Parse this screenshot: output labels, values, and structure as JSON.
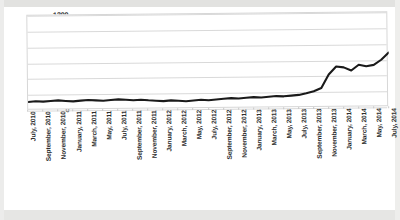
{
  "chart_data": {
    "type": "line",
    "title": "",
    "xlabel": "",
    "ylabel": "",
    "ylim": [
      0,
      1200
    ],
    "ytick_step": 200,
    "yticks": [
      1200,
      1000,
      800,
      600,
      400,
      200,
      0
    ],
    "grid": true,
    "legend": "none",
    "line_color": "#1a1a1a",
    "categories": [
      "July, 2010",
      "August, 2010",
      "September, 2010",
      "October, 2010",
      "November, 2010",
      "December, 2010",
      "January, 2011",
      "February, 2011",
      "March, 2011",
      "April, 2011",
      "May, 2011",
      "June, 2011",
      "July, 2011",
      "August, 2011",
      "September, 2011",
      "October, 2011",
      "November, 2011",
      "December, 2011",
      "January, 2012",
      "February, 2012",
      "March, 2012",
      "April, 2012",
      "May, 2012",
      "June, 2012",
      "July, 2012",
      "August, 2012",
      "September, 2012",
      "October, 2012",
      "November, 2012",
      "December, 2012",
      "January, 2013",
      "February, 2013",
      "March, 2013",
      "April, 2013",
      "May, 2013",
      "June, 2013",
      "July, 2013",
      "August, 2013",
      "September, 2013",
      "October, 2013",
      "November, 2013",
      "December, 2013",
      "January, 2014",
      "February, 2014",
      "March, 2014",
      "April, 2014",
      "May, 2014",
      "June, 2014",
      "July, 2014"
    ],
    "tick_labels": [
      "July, 2010",
      "September, 2010",
      "November, 2010",
      "January, 2011",
      "March, 2011",
      "May, 2011",
      "July, 2011",
      "September, 2011",
      "November, 2011",
      "January, 2012",
      "March, 2012",
      "May, 2012",
      "July, 2012",
      "September, 2012",
      "November, 2012",
      "January, 2013",
      "March, 2013",
      "May, 2013",
      "July, 2013",
      "September, 2013",
      "November, 2013",
      "January, 2014",
      "March, 2014",
      "May, 2014",
      "July, 2014"
    ],
    "values": [
      110,
      118,
      112,
      120,
      126,
      118,
      112,
      120,
      128,
      122,
      116,
      124,
      132,
      126,
      118,
      124,
      116,
      110,
      104,
      112,
      106,
      100,
      108,
      116,
      110,
      118,
      126,
      134,
      128,
      136,
      144,
      138,
      146,
      154,
      150,
      158,
      166,
      186,
      210,
      250,
      420,
      520,
      508,
      468,
      540,
      520,
      536,
      600,
      690
    ]
  },
  "caption": {
    "text": ""
  }
}
